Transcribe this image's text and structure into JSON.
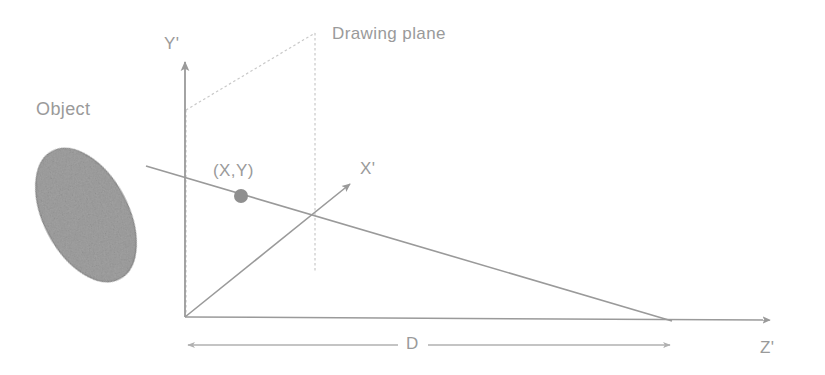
{
  "figure": {
    "type": "perspective-projection-diagram",
    "background_color": "#ffffff",
    "line_color": "#9a9a9a",
    "dashed_color": "#c8c8c8",
    "object_fill_color": "#a5a5a5",
    "object_stroke_color": "#8f8f8f"
  },
  "labels": {
    "object": "Object",
    "drawing_plane": "Drawing plane",
    "axis_y": "Y'",
    "axis_x": "X'",
    "axis_z": "Z'",
    "point": "(X,Y)",
    "distance": "D"
  },
  "geometry": {
    "origin": {
      "x": 185,
      "y": 317
    },
    "axis_y_tip": {
      "x": 185,
      "y": 58
    },
    "axis_x_tip": {
      "x": 352,
      "y": 182
    },
    "axis_z_tip": {
      "x": 770,
      "y": 320
    },
    "vanishing_point": {
      "x": 672,
      "y": 321
    },
    "projection_ray_start": {
      "x": 146,
      "y": 166
    },
    "point_marker": {
      "x": 241,
      "y": 196,
      "r": 7
    },
    "plane_corners": [
      {
        "x": 186,
        "y": 110
      },
      {
        "x": 315,
        "y": 33
      },
      {
        "x": 315,
        "y": 272
      },
      {
        "x": 186,
        "y": 317
      }
    ],
    "object_ellipse": {
      "cx": 86,
      "cy": 215,
      "rx": 42,
      "ry": 72,
      "rotation": -28
    },
    "distance_line": {
      "y": 345,
      "x_start": 186,
      "x_end": 672
    }
  },
  "label_positions": {
    "object": {
      "x": 36,
      "y": 110
    },
    "drawing_plane": {
      "x": 332,
      "y": 35
    },
    "axis_y": {
      "x": 164,
      "y": 45
    },
    "axis_x": {
      "x": 360,
      "y": 170
    },
    "axis_z": {
      "x": 760,
      "y": 349
    },
    "point": {
      "x": 213,
      "y": 172
    },
    "distance": {
      "x": 412,
      "y": 345
    }
  }
}
